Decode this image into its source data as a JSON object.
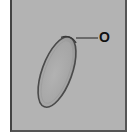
{
  "figure": {
    "annotation_label": "O",
    "colors": {
      "background": "#b3b3b3",
      "egg_fill": "#a9a9a9",
      "egg_outline": "#4a4a4a",
      "frame_border": "#444444",
      "label": "#111111"
    }
  }
}
